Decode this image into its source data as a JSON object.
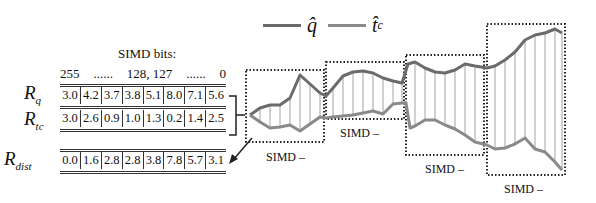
{
  "legend": {
    "items": [
      {
        "label": "q̂",
        "color": "#6b6b6b",
        "name": "q-hat"
      },
      {
        "label": "t̂",
        "sub": "c",
        "color": "#8a8a8a",
        "name": "tc-hat"
      }
    ]
  },
  "simd_bits": {
    "title": "SIMD bits:",
    "labels": [
      "255",
      "......",
      "128, 127",
      "......",
      "0"
    ]
  },
  "registers": {
    "rq": {
      "label": "R",
      "sub": "q",
      "values": [
        "3.0",
        "4.2",
        "3.7",
        "3.8",
        "5.1",
        "8.0",
        "7.1",
        "5.6"
      ]
    },
    "rtc": {
      "label": "R",
      "sub": "tc",
      "values": [
        "3.0",
        "2.6",
        "0.9",
        "1.0",
        "1.3",
        "0.2",
        "1.4",
        "2.5"
      ]
    },
    "rdist": {
      "label": "R",
      "sub": "dist",
      "values": [
        "0.0",
        "1.6",
        "2.8",
        "2.8",
        "3.8",
        "7.8",
        "5.7",
        "3.1"
      ]
    }
  },
  "simd_boxes": [
    {
      "caption": "SIMD –"
    },
    {
      "caption": "SIMD –"
    },
    {
      "caption": "SIMD –"
    },
    {
      "caption": "SIMD –"
    }
  ],
  "colors": {
    "q_line": "#6b6b6b",
    "tc_line": "#8a8a8a",
    "box_border": "#222222",
    "fill_lines": "#999999"
  }
}
